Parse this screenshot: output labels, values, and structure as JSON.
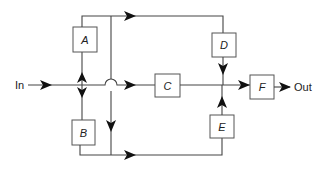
{
  "diagram": {
    "type": "block-diagram",
    "input_label": "In",
    "output_label": "Out",
    "blocks": [
      {
        "id": "A",
        "label": "A"
      },
      {
        "id": "B",
        "label": "B"
      },
      {
        "id": "C",
        "label": "C"
      },
      {
        "id": "D",
        "label": "D"
      },
      {
        "id": "E",
        "label": "E"
      },
      {
        "id": "F",
        "label": "F"
      }
    ],
    "connections": [
      {
        "from": "In",
        "to": "branch-point"
      },
      {
        "from": "branch-point",
        "to": "A"
      },
      {
        "from": "branch-point",
        "to": "B"
      },
      {
        "from": "branch-point",
        "to": "C"
      },
      {
        "from": "A",
        "to": "D",
        "via": "top-path"
      },
      {
        "from": "A",
        "to": "E",
        "via": "crossover-down-to-bottom-path"
      },
      {
        "from": "B",
        "to": "E",
        "via": "bottom-path"
      },
      {
        "from": "C",
        "to": "summing-junction"
      },
      {
        "from": "D",
        "to": "summing-junction"
      },
      {
        "from": "E",
        "to": "summing-junction"
      },
      {
        "from": "summing-junction",
        "to": "F"
      },
      {
        "from": "F",
        "to": "Out"
      }
    ]
  }
}
